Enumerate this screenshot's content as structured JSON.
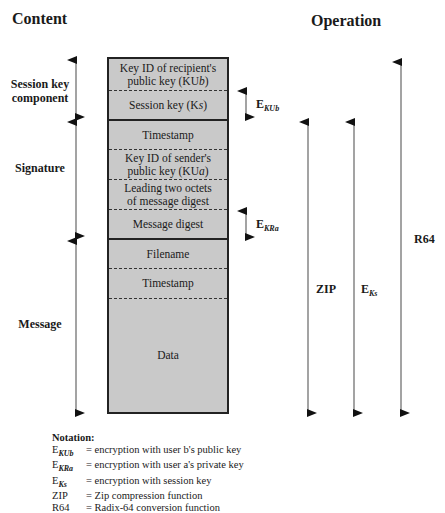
{
  "headers": {
    "content": "Content",
    "operation": "Operation"
  },
  "sections": [
    {
      "label_line1": "Session key",
      "label_line2": "component"
    },
    {
      "label_line1": "Signature",
      "label_line2": ""
    },
    {
      "label_line1": "Message",
      "label_line2": ""
    }
  ],
  "fields": [
    {
      "line1": "Key ID of recipient's",
      "line2": "public key (KU",
      "sub": "b",
      "close": ")"
    },
    {
      "line1": "Session key (K",
      "sub": "s",
      "close": ")"
    },
    {
      "line1": "Timestamp"
    },
    {
      "line1": "Key ID of sender's",
      "line2": "public key (KU",
      "sub": "a",
      "close": ")"
    },
    {
      "line1": "Leading two octets",
      "line2": "of message digest"
    },
    {
      "line1": "Message digest"
    },
    {
      "line1": "Filename"
    },
    {
      "line1": "Timestamp"
    },
    {
      "line1": "Data"
    }
  ],
  "operations": {
    "ekub": {
      "base": "E",
      "sub": "KU",
      "subsub": "b"
    },
    "ekra": {
      "base": "E",
      "sub": "KR",
      "subsub": "a"
    },
    "zip": "ZIP",
    "eks": {
      "base": "E",
      "sub": "K",
      "subsub": "s"
    },
    "r64": "R64"
  },
  "notation": {
    "title": "Notation:",
    "items": [
      {
        "sym_base": "E",
        "sym_sub": "KUb",
        "desc": "= encryption with user b's public key"
      },
      {
        "sym_base": "E",
        "sym_sub": "KRa",
        "desc": "= encryption with user a's private key"
      },
      {
        "sym_base": "E",
        "sym_sub": "Ks",
        "desc": "= encryption with session key"
      },
      {
        "sym_base": "ZIP",
        "sym_sub": "",
        "desc": "= Zip compression function"
      },
      {
        "sym_base": "R64",
        "sym_sub": "",
        "desc": "= Radix-64 conversion function"
      }
    ]
  },
  "colors": {
    "box_fill": "#c9c9c9",
    "line": "#222222",
    "arrow": "#555555"
  }
}
